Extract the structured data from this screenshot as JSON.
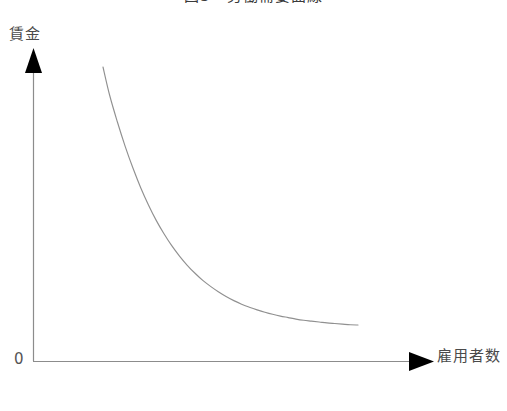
{
  "figure": {
    "title": "図3　労働需要曲線",
    "title_clipped": true,
    "background_color": "#ffffff"
  },
  "axes": {
    "origin_label": "0",
    "y_axis": {
      "label": "賃金",
      "arrow": "up-arrow-icon",
      "color": "#8c8c8c",
      "x": 33,
      "top": 72,
      "bottom": 361
    },
    "x_axis": {
      "label": "雇用者数",
      "arrow": "right-arrow-icon",
      "color": "#8c8c8c",
      "y": 361,
      "left": 33,
      "right": 412
    },
    "arrow_color": "#000000"
  },
  "chart_data": {
    "type": "line",
    "title": "図3　労働需要曲線",
    "xlabel": "雇用者数",
    "ylabel": "賃金",
    "grid": false,
    "legend": null,
    "series": [
      {
        "name": "労働需要曲線",
        "color": "#909090",
        "linewidth": 1,
        "x": [
          0.27,
          0.33,
          0.4,
          0.47,
          0.54,
          0.61,
          0.68,
          0.75,
          0.82,
          0.89,
          0.96,
          1.03,
          1.1,
          1.17,
          1.24,
          1.31,
          1.38,
          1.45,
          1.52,
          1.59,
          1.66,
          1.73,
          1.8,
          1.87,
          1.94,
          2.01,
          2.08,
          2.15,
          2.22,
          2.29,
          2.36,
          2.43,
          2.5,
          2.57
        ],
        "y": [
          1.0,
          0.905,
          0.815,
          0.733,
          0.66,
          0.594,
          0.536,
          0.484,
          0.439,
          0.399,
          0.364,
          0.333,
          0.306,
          0.282,
          0.262,
          0.244,
          0.228,
          0.214,
          0.202,
          0.192,
          0.183,
          0.175,
          0.168,
          0.162,
          0.157,
          0.152,
          0.148,
          0.145,
          0.142,
          0.139,
          0.137,
          0.135,
          0.133,
          0.132
        ],
        "shape": "convex-decreasing",
        "description": "右下がりで原点に対して凸の労働需要曲線"
      }
    ],
    "xlim": [
      0,
      1
    ],
    "ylim": [
      0,
      1
    ],
    "x_ticks": [],
    "y_ticks": [],
    "annotations": []
  }
}
